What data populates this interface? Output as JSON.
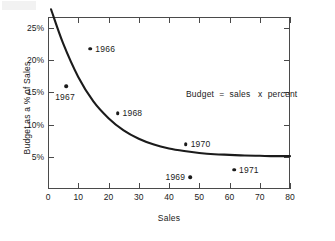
{
  "chart_data": {
    "type": "scatter",
    "title": "",
    "xlabel": "Sales",
    "ylabel": "Budget as a % of Sales",
    "xlim": [
      0,
      80
    ],
    "ylim": [
      0,
      26.7
    ],
    "grid": false,
    "legend": "none",
    "annotations": [
      {
        "text": "Budget  =  sales   x  percent",
        "x": 46,
        "y": 18.5
      }
    ],
    "xticks": [
      "0",
      "10",
      "20",
      "30",
      "40",
      "50",
      "60",
      "70",
      "80"
    ],
    "xtick_values": [
      0,
      10,
      20,
      30,
      40,
      50,
      60,
      70,
      80
    ],
    "yticks": [
      "5%",
      "10%",
      "15%",
      "20%",
      "25%"
    ],
    "ytick_values": [
      5,
      10,
      15,
      20,
      25
    ],
    "points": [
      {
        "label": "1966",
        "x": 14.0,
        "y": 21.8,
        "label_side": "right"
      },
      {
        "label": "1967",
        "x": 6.0,
        "y": 16.0,
        "label_side": "below"
      },
      {
        "label": "1968",
        "x": 23.0,
        "y": 11.8,
        "label_side": "right"
      },
      {
        "label": "1969",
        "x": 47.0,
        "y": 1.8,
        "label_side": "left"
      },
      {
        "label": "1970",
        "x": 45.5,
        "y": 7.0,
        "label_side": "right"
      },
      {
        "label": "1971",
        "x": 61.5,
        "y": 3.0,
        "label_side": "right"
      }
    ],
    "series": [
      {
        "name": "budget curve",
        "type": "line",
        "x": [
          1.0,
          5,
          10,
          15,
          20,
          25,
          30,
          35,
          40,
          45,
          50,
          55,
          60,
          65,
          70,
          75,
          80
        ],
        "values": [
          27.9,
          22.6,
          17.4,
          13.6,
          11.0,
          9.1,
          7.8,
          6.9,
          6.3,
          5.9,
          5.6,
          5.4,
          5.3,
          5.2,
          5.15,
          5.1,
          5.1
        ]
      }
    ],
    "axis_color": "#4a4a4a",
    "curve_color": "#1b1b1b",
    "point_color": "#1b1b1b",
    "background": "#ffffff"
  }
}
